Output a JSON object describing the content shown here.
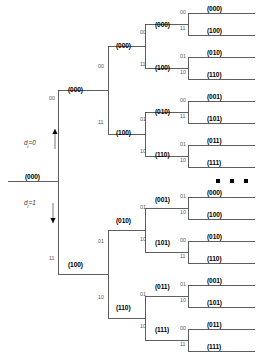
{
  "figure": {
    "type": "binary-tree-diagram",
    "title": "",
    "axis_labels": [
      {
        "id": "d-zero",
        "text": "d",
        "sub": "j",
        "eq": "=0",
        "arrow": "up",
        "x": 24,
        "y": 140,
        "arrow_x": 55,
        "arrow_y0": 149,
        "arrow_y1": 129
      },
      {
        "id": "d-one",
        "text": "d",
        "sub": "j",
        "eq": "=1",
        "arrow": "down",
        "x": 24,
        "y": 200,
        "arrow_x": 53,
        "arrow_y0": 203,
        "arrow_y1": 223
      }
    ],
    "ellipsis_dots": [
      {
        "x": 216,
        "y": 179
      },
      {
        "x": 230,
        "y": 179
      },
      {
        "x": 244,
        "y": 179
      }
    ],
    "root": {
      "label": "(000)",
      "x": 25,
      "y": 174
    },
    "level1": [
      {
        "label": "(000)",
        "bits": "00",
        "x": 68,
        "y": 87,
        "bits_x": 49,
        "bits_y": 96
      },
      {
        "label": "(100)",
        "bits": "11",
        "x": 68,
        "y": 262,
        "bits_x": 49,
        "bits_y": 256
      }
    ],
    "level2": [
      {
        "label": "(000)",
        "bits": "00",
        "x": 116,
        "y": 43,
        "bits_x": 98,
        "bits_y": 64
      },
      {
        "label": "(100)",
        "bits": "11",
        "x": 116,
        "y": 130,
        "bits_x": 98,
        "bits_y": 120
      },
      {
        "label": "(010)",
        "bits": "01",
        "x": 116,
        "y": 218,
        "bits_x": 98,
        "bits_y": 239
      },
      {
        "label": "(110)",
        "bits": "10",
        "x": 116,
        "y": 305,
        "bits_x": 98,
        "bits_y": 295
      }
    ],
    "level3": [
      {
        "label": "(000)",
        "bits": "00",
        "x": 155,
        "y": 22,
        "bits_x": 140,
        "bits_y": 30
      },
      {
        "label": "(100)",
        "bits": "11",
        "x": 155,
        "y": 65,
        "bits_x": 140,
        "bits_y": 62
      },
      {
        "label": "(010)",
        "bits": "01",
        "x": 155,
        "y": 109,
        "bits_x": 140,
        "bits_y": 117
      },
      {
        "label": "(110)",
        "bits": "10",
        "x": 155,
        "y": 152,
        "bits_x": 140,
        "bits_y": 149
      },
      {
        "label": "(001)",
        "bits": "01",
        "x": 155,
        "y": 197,
        "bits_x": 140,
        "bits_y": 205
      },
      {
        "label": "(101)",
        "bits": "10",
        "x": 155,
        "y": 240,
        "bits_x": 140,
        "bits_y": 237
      },
      {
        "label": "(011)",
        "bits": "01",
        "x": 155,
        "y": 284,
        "bits_x": 140,
        "bits_y": 292
      },
      {
        "label": "(111)",
        "bits": "10",
        "x": 155,
        "y": 327,
        "bits_x": 140,
        "bits_y": 324
      }
    ],
    "leaves": [
      {
        "label": "(000)",
        "bits": "00",
        "x": 207,
        "y": 6,
        "bits_x": 180,
        "bits_y": 10
      },
      {
        "label": "(100)",
        "bits": "11",
        "x": 207,
        "y": 28,
        "bits_x": 180,
        "bits_y": 26
      },
      {
        "label": "(010)",
        "bits": "01",
        "x": 207,
        "y": 50,
        "bits_x": 180,
        "bits_y": 54
      },
      {
        "label": "(110)",
        "bits": "10",
        "x": 207,
        "y": 72,
        "bits_x": 180,
        "bits_y": 70
      },
      {
        "label": "(001)",
        "bits": "00",
        "x": 207,
        "y": 94,
        "bits_x": 180,
        "bits_y": 98
      },
      {
        "label": "(101)",
        "bits": "11",
        "x": 207,
        "y": 116,
        "bits_x": 180,
        "bits_y": 114
      },
      {
        "label": "(011)",
        "bits": "01",
        "x": 207,
        "y": 138,
        "bits_x": 180,
        "bits_y": 142
      },
      {
        "label": "(111)",
        "bits": "10",
        "x": 207,
        "y": 160,
        "bits_x": 180,
        "bits_y": 158
      },
      {
        "label": "(000)",
        "bits": "01",
        "x": 207,
        "y": 190,
        "bits_x": 180,
        "bits_y": 194
      },
      {
        "label": "(100)",
        "bits": "10",
        "x": 207,
        "y": 212,
        "bits_x": 180,
        "bits_y": 210
      },
      {
        "label": "(010)",
        "bits": "00",
        "x": 207,
        "y": 234,
        "bits_x": 180,
        "bits_y": 238
      },
      {
        "label": "(110)",
        "bits": "11",
        "x": 207,
        "y": 256,
        "bits_x": 180,
        "bits_y": 254
      },
      {
        "label": "(001)",
        "bits": "01",
        "x": 207,
        "y": 278,
        "bits_x": 180,
        "bits_y": 282
      },
      {
        "label": "(101)",
        "bits": "10",
        "x": 207,
        "y": 300,
        "bits_x": 180,
        "bits_y": 298
      },
      {
        "label": "(011)",
        "bits": "00",
        "x": 207,
        "y": 322,
        "bits_x": 180,
        "bits_y": 326
      },
      {
        "label": "(111)",
        "bits": "11",
        "x": 207,
        "y": 344,
        "bits_x": 180,
        "bits_y": 342
      }
    ],
    "geometry": {
      "root_stub_x0": 8,
      "root_stub_x1": 58,
      "root_y": 181,
      "col_x": [
        58,
        108,
        145,
        188
      ],
      "leaf_end_x": 255
    },
    "colors": {
      "line": "#4d4d4d",
      "text": "#000000",
      "bit_text": "#555555",
      "dot": "#000000"
    }
  }
}
